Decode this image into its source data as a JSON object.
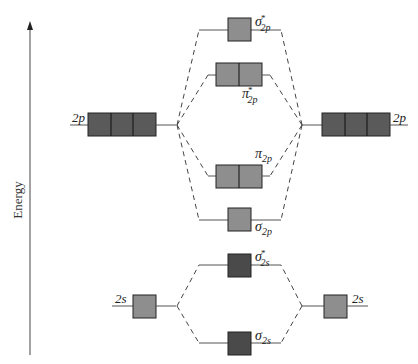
{
  "diagram": {
    "type": "molecular-orbital-diagram",
    "axis_label": "Energy",
    "atomic_orbitals": {
      "left": [
        {
          "name": "2p",
          "label": "2p",
          "boxes": 3,
          "color": "#5a5a5a"
        },
        {
          "name": "2s",
          "label": "2s",
          "boxes": 1,
          "color": "#8e8e8e"
        }
      ],
      "right": [
        {
          "name": "2p",
          "label": "2p",
          "boxes": 3,
          "color": "#5a5a5a"
        },
        {
          "name": "2s",
          "label": "2s",
          "boxes": 1,
          "color": "#8e8e8e"
        }
      ]
    },
    "molecular_orbitals": [
      {
        "name": "sigma-star-2p",
        "symbol": "σ",
        "sup": "*",
        "sub": "2p",
        "boxes": 1,
        "color": "#8e8e8e"
      },
      {
        "name": "pi-star-2p",
        "symbol": "π",
        "sup": "*",
        "sub": "2p",
        "boxes": 2,
        "color": "#8e8e8e"
      },
      {
        "name": "pi-2p",
        "symbol": "π",
        "sup": "",
        "sub": "2p",
        "boxes": 2,
        "color": "#8e8e8e"
      },
      {
        "name": "sigma-2p",
        "symbol": "σ",
        "sup": "",
        "sub": "2p",
        "boxes": 1,
        "color": "#8e8e8e"
      },
      {
        "name": "sigma-star-2s",
        "symbol": "σ",
        "sup": "*",
        "sub": "2s",
        "boxes": 1,
        "color": "#4a4a4a"
      },
      {
        "name": "sigma-2s",
        "symbol": "σ",
        "sup": "",
        "sub": "2s",
        "boxes": 1,
        "color": "#4a4a4a"
      }
    ]
  }
}
